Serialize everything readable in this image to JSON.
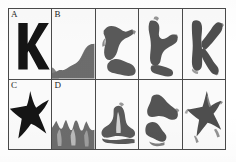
{
  "figure": {
    "caption_labels": [
      "A",
      "B",
      "C",
      "D"
    ],
    "grid": {
      "rows": 2,
      "columns": 5
    },
    "border_color": "#4a4a4a",
    "background_color": "#ffffff",
    "ink_color_dark": "#1a1a1a",
    "ink_color_gray": "#6e6e6e"
  },
  "panels": [
    {
      "id": "panel-a",
      "label": "A",
      "row": 1,
      "column": 1,
      "content": "letter-K-template",
      "shape_name": "letter-k",
      "fill": "#151515",
      "description": "Clean bold black letter K on white background"
    },
    {
      "id": "panel-b",
      "label": "B",
      "row": 1,
      "column": 2,
      "content": "noise-blob",
      "shape_name": "gray-blob-bottom",
      "fill": "#6e6e6e",
      "description": "Gray amorphous blob rising from bottom right"
    },
    {
      "id": "panel-r1c3",
      "label": "",
      "row": 1,
      "column": 3,
      "content": "partial-K",
      "shape_name": "partial-letter-k",
      "fill": "#5a5a5a",
      "description": "Partially formed dark K shape, two disconnected masses"
    },
    {
      "id": "panel-r1c4",
      "label": "",
      "row": 1,
      "column": 4,
      "content": "emerging-K",
      "shape_name": "emerging-letter-k",
      "fill": "#555555",
      "description": "More defined K shape with arm and leg emerging"
    },
    {
      "id": "panel-r1c5",
      "label": "",
      "row": 1,
      "column": 5,
      "content": "recovered-K",
      "shape_name": "recovered-letter-k",
      "fill": "#4f4f4f",
      "description": "Clearly recognizable rough K shape"
    },
    {
      "id": "panel-c",
      "label": "C",
      "row": 2,
      "column": 1,
      "content": "starfish-template",
      "shape_name": "five-point-star",
      "fill": "#151515",
      "description": "Clean black five pointed starfish on white background"
    },
    {
      "id": "panel-d",
      "label": "D",
      "row": 2,
      "column": 2,
      "content": "noise-ridge",
      "shape_name": "gray-jagged-ridge",
      "fill": "#6e6e6e",
      "description": "Jagged gray mountain-like ridge across bottom"
    },
    {
      "id": "panel-r2c3",
      "label": "",
      "row": 2,
      "column": 3,
      "content": "partial-star",
      "shape_name": "partial-star",
      "fill": "#5a5a5a",
      "description": "Partially formed star mass with notch at top"
    },
    {
      "id": "panel-r2c4",
      "label": "",
      "row": 2,
      "column": 4,
      "content": "emerging-star",
      "shape_name": "emerging-star",
      "fill": "#555555",
      "description": "Two separated blobs beginning to resemble star arms"
    },
    {
      "id": "panel-r2c5",
      "label": "",
      "row": 2,
      "column": 5,
      "content": "recovered-star",
      "shape_name": "recovered-star",
      "fill": "#4f4f4f",
      "description": "Clearly recognizable rough five pointed star"
    }
  ]
}
